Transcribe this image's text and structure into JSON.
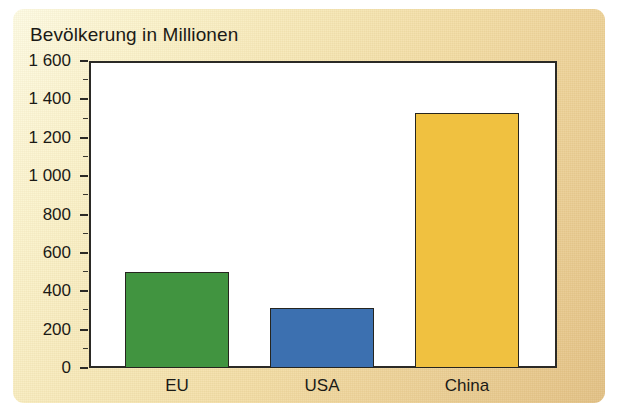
{
  "chart_data": {
    "type": "bar",
    "title": "Bevölkerung in Millionen",
    "xlabel": "",
    "ylabel": "",
    "categories": [
      "EU",
      "USA",
      "China"
    ],
    "values": [
      500,
      312,
      1330
    ],
    "series": [
      {
        "name": "Bevölkerung in Millionen",
        "values": [
          500,
          312,
          1330
        ]
      }
    ],
    "colors": [
      "#419440",
      "#3C70B0",
      "#F0C140"
    ],
    "bar_border_color": "#26251F",
    "ylim": [
      0,
      1600
    ],
    "ytick_values": [
      0,
      200,
      400,
      600,
      800,
      1000,
      1200,
      1400,
      1600
    ],
    "ytick_labels": [
      "0",
      "200",
      "400",
      "600",
      "800",
      "1 000",
      "1 200",
      "1 400",
      "1 600"
    ],
    "yminor_values": [
      100,
      300,
      500,
      700,
      900,
      1100,
      1300,
      1500
    ],
    "grid": false,
    "legend": false,
    "plot_background": "#FFFFFF",
    "panel_background": "#F4E0A8",
    "axis_color": "#2B2A26"
  },
  "figure": {
    "title": "Bevölkerung in Millionen"
  }
}
